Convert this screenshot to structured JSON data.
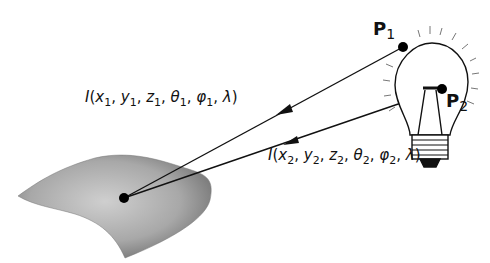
{
  "diagram": {
    "points": [
      {
        "name": "P",
        "subscript": "1"
      },
      {
        "name": "P",
        "subscript": "2"
      }
    ],
    "labels": {
      "ray1": {
        "func": "I",
        "args": [
          [
            "x",
            "1"
          ],
          [
            "y",
            "1"
          ],
          [
            "z",
            "1"
          ],
          [
            "θ",
            "1"
          ],
          [
            "φ",
            "1"
          ],
          [
            "λ",
            ""
          ]
        ]
      },
      "ray2": {
        "func": "I",
        "args": [
          [
            "x",
            "2"
          ],
          [
            "y",
            "2"
          ],
          [
            "z",
            "2"
          ],
          [
            "θ",
            "2"
          ],
          [
            "φ",
            "2"
          ],
          [
            "λ",
            ""
          ]
        ]
      }
    },
    "colors": {
      "ink": "#111111",
      "surface_light": "#c8c8c8",
      "surface_dark": "#6e6e6e",
      "background": "#ffffff"
    }
  }
}
